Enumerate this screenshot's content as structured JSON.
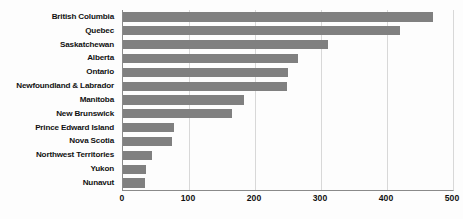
{
  "chart_data": {
    "type": "bar",
    "orientation": "horizontal",
    "title": "",
    "subtitle": "",
    "xlabel": "",
    "ylabel": "",
    "xlim": [
      0,
      500
    ],
    "xticks": [
      0,
      100,
      200,
      300,
      400,
      500
    ],
    "xticklabels": [
      "0",
      "100",
      "200",
      "300",
      "400",
      "500"
    ],
    "grid": "vertical",
    "legend": "none",
    "bar_color": "#808080",
    "categories": [
      "British Columbia",
      "Quebec",
      "Saskatchewan",
      "Alberta",
      "Ontario",
      "Newfoundland & Labrador",
      "Manitoba",
      "New Brunswick",
      "Prince Edward Island",
      "Nova Scotia",
      "Northwest Territories",
      "Yukon",
      "Nunavut"
    ],
    "values": [
      470,
      420,
      310,
      265,
      250,
      248,
      183,
      165,
      78,
      74,
      44,
      35,
      34
    ]
  }
}
